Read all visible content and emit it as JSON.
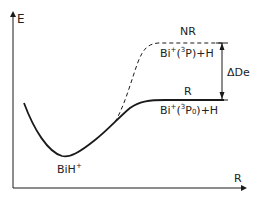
{
  "diagram": {
    "title": "",
    "axes": {
      "y_label": "E",
      "x_label": "R"
    },
    "curves": [
      {
        "name": "R",
        "style": "solid",
        "label": "R",
        "asymptote_label": {
          "base": "Bi",
          "charge": "+",
          "state_open": "(",
          "state_sup": "3",
          "state_main": "P",
          "state_sub": "0",
          "state_close": ")+H"
        }
      },
      {
        "name": "NR",
        "style": "dashed",
        "label": "NR",
        "asymptote_label": {
          "base": "Bi",
          "charge": "+",
          "state_open": "(",
          "state_sup": "3",
          "state_main": "P",
          "state_sub": "",
          "state_close": ")+H"
        }
      }
    ],
    "minimum_label": {
      "base": "BiH",
      "charge": "+"
    },
    "gap_label": "ΔDe",
    "colors": {
      "line": "#1a1a1a",
      "text": "#222222",
      "background": "#ffffff"
    }
  }
}
